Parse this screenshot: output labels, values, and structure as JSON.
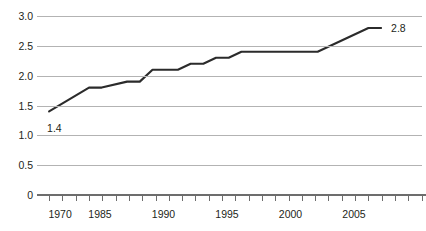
{
  "chart_data": {
    "type": "line",
    "title": "",
    "subtitle": "",
    "xlabel": "",
    "ylabel": "",
    "xlim": [
      1970,
      2008
    ],
    "ylim": [
      0,
      3.0
    ],
    "grid": true,
    "legend": null,
    "y_ticks": [
      "3.0",
      "2.5",
      "2.0",
      "1.5",
      "1.0",
      "0.5",
      "0"
    ],
    "y_tick_values": [
      3.0,
      2.5,
      2.0,
      1.5,
      1.0,
      0.5,
      0
    ],
    "x_ticks": [
      "1970",
      "1985",
      "1990",
      "1995",
      "2000",
      "2005"
    ],
    "x_tick_values": [
      1970,
      1985,
      1990,
      1995,
      2000,
      2005
    ],
    "series": [
      {
        "name": "value",
        "x": [
          1970,
          1985,
          1986,
          1988,
          1989,
          1990,
          1992,
          1993,
          1994,
          1995,
          1996,
          1997,
          2003,
          2007,
          2008
        ],
        "values": [
          1.4,
          1.8,
          1.8,
          1.9,
          1.9,
          2.1,
          2.1,
          2.2,
          2.2,
          2.3,
          2.3,
          2.4,
          2.4,
          2.8,
          2.8
        ]
      }
    ],
    "annotations": [
      {
        "name": "start-value-label",
        "text": "1.4",
        "x": 1970,
        "y": 1.4
      },
      {
        "name": "end-value-label",
        "text": "2.8",
        "x": 2008,
        "y": 2.8
      }
    ]
  }
}
